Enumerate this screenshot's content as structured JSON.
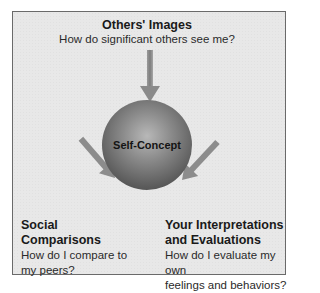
{
  "diagram": {
    "center": {
      "label": "Self-Concept"
    },
    "inputs": [
      {
        "title": "Others' Images",
        "subtitle": "How do significant others see me?",
        "position": "top"
      },
      {
        "title": "Social Comparisons",
        "subtitle_lines": [
          "How do I compare to",
          "my peers?"
        ],
        "position": "bottom-left"
      },
      {
        "title_lines": [
          "Your Interpretations",
          "and Evaluations"
        ],
        "subtitle_lines": [
          "How do I evaluate my own",
          "feelings and behaviors?"
        ],
        "position": "bottom-right"
      }
    ],
    "colors": {
      "background": "#e8e8e8",
      "border": "#6a6a6a",
      "arrow": "#8c8c8c",
      "sphere": "#6e6e6e"
    }
  }
}
